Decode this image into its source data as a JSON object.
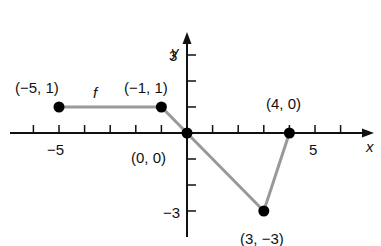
{
  "chart_data": {
    "type": "line",
    "title": "",
    "function_label": "f",
    "xlabel": "x",
    "ylabel": "y",
    "xlim": [
      -7,
      7
    ],
    "ylim": [
      -4,
      4
    ],
    "x_tick_labels": [
      {
        "value": -5,
        "label": "−5"
      },
      {
        "value": 5,
        "label": "5"
      }
    ],
    "y_tick_labels": [
      {
        "value": 3,
        "label": "3"
      },
      {
        "value": -3,
        "label": "−3"
      }
    ],
    "x_ticks": [
      -6,
      -5,
      -4,
      -3,
      -2,
      -1,
      1,
      2,
      3,
      4,
      5,
      6
    ],
    "y_ticks": [
      -3,
      -2,
      -1,
      1,
      2,
      3
    ],
    "grid": false,
    "line_color": "#999999",
    "point_color": "#000000",
    "points": [
      {
        "x": -5,
        "y": 1,
        "label": "(−5, 1)"
      },
      {
        "x": -1,
        "y": 1,
        "label": "(−1, 1)"
      },
      {
        "x": 0,
        "y": 0,
        "label": "(0, 0)"
      },
      {
        "x": 3,
        "y": -3,
        "label": "(3, −3)"
      },
      {
        "x": 4,
        "y": 0,
        "label": "(4, 0)"
      }
    ]
  }
}
